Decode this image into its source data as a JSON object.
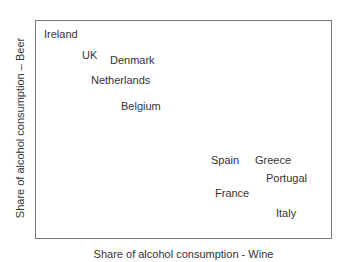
{
  "chart_data": {
    "type": "scatter",
    "title": "",
    "xlabel": "Share of alcohol consumption - Wine",
    "ylabel": "Share of alcohol consumption – Beer",
    "grid": false,
    "legend": null,
    "points": [
      {
        "label": "Ireland",
        "px": 44,
        "py": 35
      },
      {
        "label": "UK",
        "px": 82,
        "py": 56
      },
      {
        "label": "Denmark",
        "px": 110,
        "py": 61
      },
      {
        "label": "Netherlands",
        "px": 91,
        "py": 81
      },
      {
        "label": "Belgium",
        "px": 121,
        "py": 107
      },
      {
        "label": "Spain",
        "px": 211,
        "py": 161
      },
      {
        "label": "Greece",
        "px": 255,
        "py": 161
      },
      {
        "label": "Portugal",
        "px": 266,
        "py": 179
      },
      {
        "label": "France",
        "px": 215,
        "py": 194
      },
      {
        "label": "Italy",
        "px": 276,
        "py": 214
      }
    ]
  }
}
